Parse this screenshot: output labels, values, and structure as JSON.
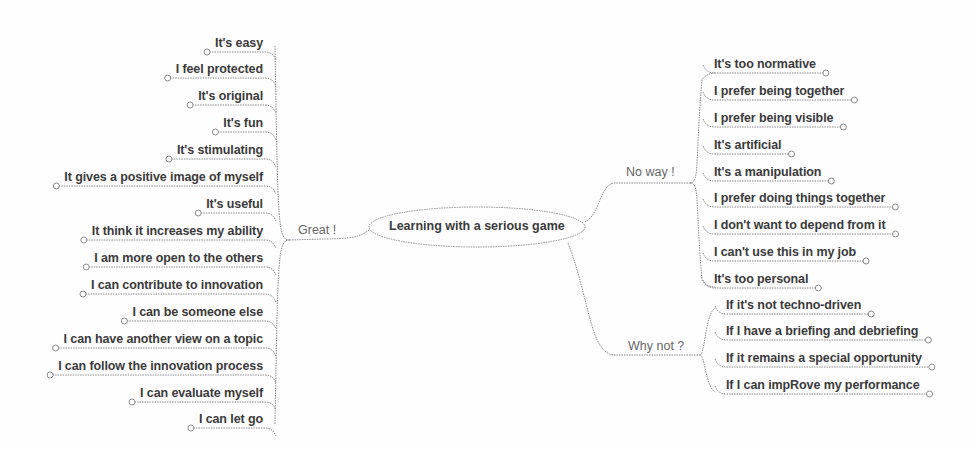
{
  "root": {
    "label": "Learning with a serious game"
  },
  "branches": {
    "great": {
      "label": "Great !",
      "items": [
        "It's easy",
        "I feel protected",
        "It's original",
        "It's fun",
        "It's stimulating",
        "It gives a positive image of myself",
        "It's useful",
        "It think it increases my ability",
        "I am more open to the others",
        "I can contribute to innovation",
        "I can be someone else",
        "I can have another view on a topic",
        "I can follow the innovation process",
        "I can evaluate myself",
        "I can let go"
      ]
    },
    "no_way": {
      "label": "No way !",
      "items": [
        "It's too normative",
        "I prefer being together",
        "I prefer being visible",
        "It's artificial",
        "It's a manipulation",
        "I prefer doing things together",
        "I don't want to depend from it",
        "I can't use this in my job",
        "It's too personal"
      ]
    },
    "why_not": {
      "label": "Why not ?",
      "items": [
        "If it's not techno-driven",
        "If I have a briefing and debriefing",
        "If it remains a special opportunity",
        "If I can impRove my performance"
      ]
    }
  },
  "colors": {
    "text": "#3a3a3a",
    "branch_text": "#666666",
    "line": "#8a8a8a",
    "background": "#fefefe"
  }
}
